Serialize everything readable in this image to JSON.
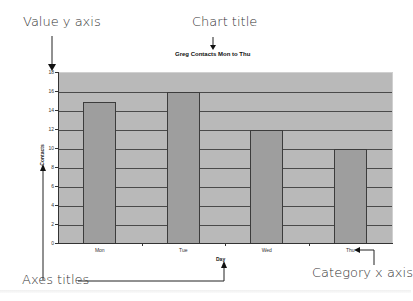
{
  "callouts": {
    "value_y_axis": "Value y axis",
    "chart_title": "Chart title",
    "axes_titles": "Axes titles",
    "category_x_axis": "Category x axis"
  },
  "chart_data": {
    "type": "bar",
    "title": "Greg Contacts Mon to Thu",
    "xlabel": "Day",
    "ylabel": "Contacts",
    "categories": [
      "Mon",
      "Tue",
      "Wed",
      "Thu"
    ],
    "values": [
      15,
      16,
      12,
      10
    ],
    "ylim": [
      0,
      18
    ],
    "yticks": [
      "0",
      "2",
      "4",
      "6",
      "8",
      "10",
      "12",
      "14",
      "16",
      "18"
    ],
    "grid": true,
    "legend": "none",
    "colors": {
      "plot_bg": "#b9b9b9",
      "bar": "#9e9e9e",
      "gridline": "#4a4a4a"
    }
  }
}
